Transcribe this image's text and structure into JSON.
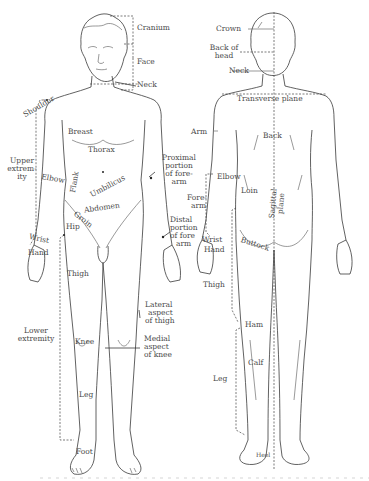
{
  "figure": {
    "anterior_labels": {
      "cranium": "Cranium",
      "face": "Face",
      "neck": "Neck",
      "shoulder": "Shoulder",
      "breast": "Breast",
      "thorax": "Thorax",
      "upper_extremity": [
        "Upper",
        "extrem-",
        "ity"
      ],
      "elbow": "Elbow",
      "flank": "Flank",
      "umbilicus": "Umbilicus",
      "abdomen": "Abdomen",
      "groin": "Groin",
      "hip": "Hip",
      "wrist": "Wrist",
      "hand": "Hand",
      "thigh": "Thigh",
      "proximal_forearm": [
        "Proximal",
        "portion",
        "of fore-",
        "arm"
      ],
      "distal_forearm": [
        "Distal",
        "portion",
        "of fore",
        "arm"
      ],
      "lateral_thigh": [
        "Lateral",
        "aspect",
        "of thigh"
      ],
      "lower_extremity": [
        "Lower",
        "extremity"
      ],
      "knee": "Knee",
      "medial_knee": [
        "Medial",
        "aspect",
        "of knee"
      ],
      "leg": "Leg",
      "foot": "Foot"
    },
    "posterior_labels": {
      "crown": "Crown",
      "back_of_head": [
        "Back of",
        "head"
      ],
      "neck": "Neck",
      "transverse_plane": "Transverse plane",
      "arm": "Arm",
      "back": "Back",
      "elbow": "Elbow",
      "loin": "Loin",
      "forearm": [
        "Fore-",
        "arm"
      ],
      "sagittal_plane": [
        "Sagittal",
        "plane"
      ],
      "wrist": "Wrist",
      "hand": "Hand",
      "buttock": "Buttock",
      "thigh": "Thigh",
      "ham": "Ham",
      "calf": "Calf",
      "leg": "Leg",
      "heel": "Heel"
    },
    "colors": {
      "line": "#3a3a3a",
      "label": "#4a4a4a",
      "background": "#ffffff"
    }
  }
}
